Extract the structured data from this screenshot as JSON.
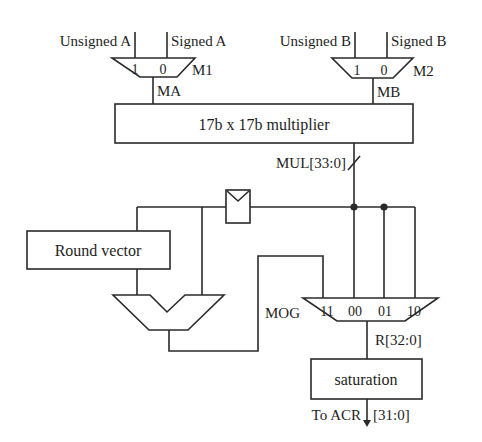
{
  "diagram": {
    "title": "",
    "colors": {
      "line": "#2a2a2a",
      "text": "#1e1e1e",
      "background": "#ffffff"
    },
    "inputs": {
      "unsigned_a": "Unsigned A",
      "signed_a": "Signed A",
      "unsigned_b": "Unsigned B",
      "signed_b": "Signed B"
    },
    "mux_m1": {
      "name": "M1",
      "in1": "1",
      "in0": "0",
      "output": "MA"
    },
    "mux_m2": {
      "name": "M2",
      "in1": "1",
      "in0": "0",
      "output": "MB"
    },
    "multiplier": {
      "label": "17b x 17b multiplier",
      "output_bus": "MUL[33:0]"
    },
    "round_vector": {
      "label": "Round vector"
    },
    "register": {
      "label": ""
    },
    "adder": {
      "label": ""
    },
    "mog_mux": {
      "name": "MOG",
      "inputs": [
        "11",
        "00",
        "01",
        "10"
      ],
      "output_bus": "R[32:0]"
    },
    "saturation": {
      "label": "saturation"
    },
    "output": {
      "label": "To ACR",
      "bus": "[31:0]"
    }
  }
}
